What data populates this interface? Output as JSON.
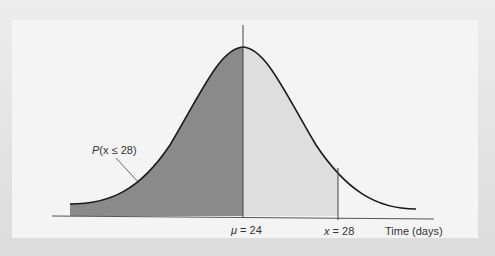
{
  "diagram": {
    "type": "normal-distribution",
    "mean_label_symbol": "μ",
    "mean_label_rest": " = 24",
    "x_label_symbol": "x",
    "x_label_rest": " = 28",
    "axis_label": "Time (days)",
    "area_label_p": "P",
    "area_label_rest": "(x ≤ 28)",
    "mean": 24,
    "x_value": 28
  },
  "colors": {
    "dark_fill": "#8a8a8a",
    "light_fill": "#dedede",
    "curve": "#1a1a1a",
    "panel": "#f4f4f4"
  }
}
